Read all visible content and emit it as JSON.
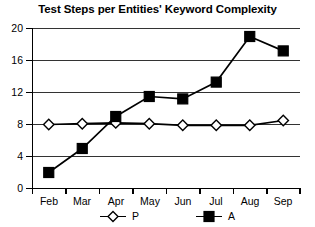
{
  "chart_data": {
    "type": "line",
    "title": "Test Steps per Entities' Keyword Complexity",
    "xlabel": "",
    "ylabel": "",
    "categories": [
      "Feb",
      "Mar",
      "Apr",
      "May",
      "Jun",
      "Jul",
      "Aug",
      "Sep"
    ],
    "series": [
      {
        "name": "P",
        "marker": "open-diamond",
        "color": "#000000",
        "values": [
          8.0,
          8.1,
          8.2,
          8.1,
          7.9,
          7.9,
          7.9,
          8.5
        ]
      },
      {
        "name": "A",
        "marker": "filled-square",
        "color": "#000000",
        "values": [
          2.0,
          5.0,
          9.0,
          11.5,
          11.2,
          13.3,
          19.0,
          17.2
        ]
      }
    ],
    "ylim": [
      0,
      20
    ],
    "yticks": [
      0,
      4,
      8,
      12,
      16,
      20
    ],
    "ytick_labels": [
      "0",
      "4",
      "8",
      "12",
      "16",
      "20"
    ],
    "grid": "horizontal",
    "legend_position": "bottom",
    "legend": [
      {
        "label": "P",
        "marker": "open-diamond"
      },
      {
        "label": "A",
        "marker": "filled-square"
      }
    ]
  }
}
